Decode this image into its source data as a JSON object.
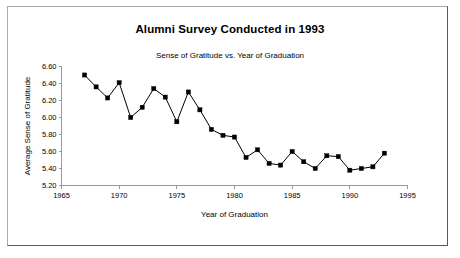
{
  "chart_data": {
    "type": "line",
    "title": "Alumni Survey Conducted in 1993",
    "subtitle": "Sense of Gratitude vs. Year of Graduation",
    "xlabel": "Year of Graduation",
    "ylabel": "Average Sense of Gratitude",
    "xlim": [
      1965,
      1995
    ],
    "ylim": [
      5.2,
      6.6
    ],
    "xticks": [
      1965,
      1970,
      1975,
      1980,
      1985,
      1990,
      1995
    ],
    "xtick_labels": [
      "1965",
      "1970",
      "1975",
      "1980",
      "1985",
      "1990",
      "1995"
    ],
    "yticks": [
      5.2,
      5.4,
      5.6,
      5.8,
      6.0,
      6.2,
      6.4,
      6.6
    ],
    "ytick_labels": [
      "5.20",
      "5.40",
      "5.60",
      "5.80",
      "6.00",
      "6.20",
      "6.40",
      "6.60"
    ],
    "grid": false,
    "legend": false,
    "marker": "square",
    "marker_color": "#000000",
    "line_color": "#000000",
    "x": [
      1967,
      1968,
      1969,
      1970,
      1971,
      1972,
      1973,
      1974,
      1975,
      1976,
      1977,
      1978,
      1979,
      1980,
      1981,
      1982,
      1983,
      1984,
      1985,
      1986,
      1987,
      1988,
      1989,
      1990,
      1991,
      1992,
      1993
    ],
    "values": [
      6.5,
      6.36,
      6.23,
      6.41,
      6.0,
      6.12,
      6.34,
      6.24,
      5.95,
      6.3,
      6.09,
      5.86,
      5.79,
      5.77,
      5.53,
      5.62,
      5.46,
      5.44,
      5.6,
      5.48,
      5.4,
      5.55,
      5.54,
      5.38,
      5.4,
      5.42,
      5.58
    ],
    "series": [
      {
        "name": "Average Sense of Gratitude",
        "values": [
          6.5,
          6.36,
          6.23,
          6.41,
          6.0,
          6.12,
          6.34,
          6.24,
          5.95,
          6.3,
          6.09,
          5.86,
          5.79,
          5.77,
          5.53,
          5.62,
          5.46,
          5.44,
          5.6,
          5.48,
          5.4,
          5.55,
          5.54,
          5.38,
          5.4,
          5.42,
          5.58
        ]
      }
    ]
  }
}
